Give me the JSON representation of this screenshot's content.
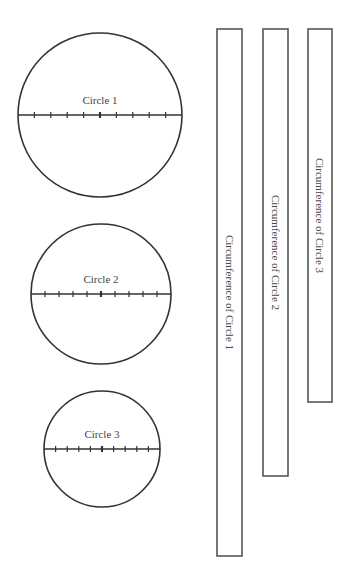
{
  "style": {
    "stroke_color": "#333333",
    "text_color": "#444444",
    "background": "#ffffff"
  },
  "circles": [
    {
      "label": "Circle 1",
      "cx": 100,
      "cy": 115,
      "r": 82,
      "ticks": 9
    },
    {
      "label": "Circle 2",
      "cx": 101,
      "cy": 294,
      "r": 70,
      "ticks": 9
    },
    {
      "label": "Circle 3",
      "cx": 102,
      "cy": 449,
      "r": 58,
      "ticks": 9
    }
  ],
  "strips": [
    {
      "label": "Circumference of Circle 1",
      "x": 217,
      "y": 29,
      "w": 25,
      "h": 527
    },
    {
      "label": "Circumference of Circle 2",
      "x": 263,
      "y": 29,
      "w": 25,
      "h": 447
    },
    {
      "label": "Circumference of Circle 3",
      "x": 308,
      "y": 29,
      "w": 24,
      "h": 373
    }
  ]
}
